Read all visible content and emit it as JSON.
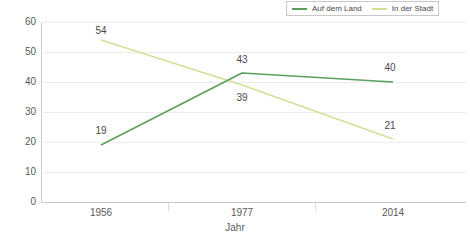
{
  "chart_data": {
    "type": "line",
    "title": "",
    "subtitle": "",
    "xlabel": "Jahr",
    "ylabel": "",
    "categories": [
      "1956",
      "1977",
      "2014"
    ],
    "ylim": [
      0,
      60
    ],
    "ytick_step": 10,
    "yticks": [
      "60",
      "50",
      "40",
      "30",
      "20",
      "10",
      "0"
    ],
    "grid": true,
    "legend_position": "top-right",
    "series": [
      {
        "name": "Auf dem Land",
        "color": "#5aa05a",
        "values": [
          19,
          43,
          40
        ],
        "labels": [
          "19",
          "43",
          "40"
        ]
      },
      {
        "name": "In der Stadt",
        "color": "#d8de97",
        "values": [
          54,
          39,
          21
        ],
        "labels": [
          "54",
          "39",
          "21"
        ]
      }
    ]
  },
  "legend": {
    "entries": [
      {
        "label": "Auf dem Land",
        "swatch": "legend-swatch-auf-dem-land"
      },
      {
        "label": "In der Stadt",
        "swatch": "legend-swatch-in-der-stadt"
      }
    ]
  },
  "axes": {
    "y_tick_labels": [
      "60",
      "50",
      "40",
      "30",
      "20",
      "10",
      "0"
    ],
    "x_tick_labels": [
      "1956",
      "1977",
      "2014"
    ],
    "x_axis_title": "Jahr"
  },
  "colors": {
    "series_land": "#5aa05a",
    "series_stadt": "#d8de97",
    "grid": "#ececec",
    "axis": "#c9c9c9",
    "text": "#5a5a5a",
    "legend_border": "#c8c8c8",
    "background": "#ffffff"
  }
}
